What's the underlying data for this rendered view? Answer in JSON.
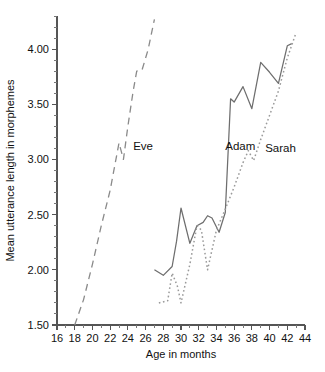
{
  "chart_data": {
    "type": "line",
    "title": "",
    "xlabel": "Age in months",
    "ylabel": "Mean utterance length in morphemes",
    "xlim": [
      16,
      44
    ],
    "ylim": [
      1.5,
      4.3
    ],
    "xticks": [
      16,
      18,
      20,
      22,
      24,
      26,
      28,
      30,
      32,
      34,
      36,
      38,
      40,
      42,
      44
    ],
    "xticklabels": [
      "16",
      "18",
      "20",
      "22",
      "24",
      "26",
      "28",
      "30",
      "32",
      "34",
      "36",
      "38",
      "40",
      "42",
      "44"
    ],
    "yticks": [
      1.5,
      2.0,
      2.5,
      3.0,
      3.5,
      4.0
    ],
    "yticklabels": [
      "1.50",
      "2.00",
      "2.50",
      "3.00",
      "3.50",
      "4.00"
    ],
    "x_minor_step": 1,
    "y_minor_step": 0.1,
    "grid": false,
    "legend": "inline-labels",
    "series": [
      {
        "name": "Eve",
        "style": "dashed",
        "color": "#8a8a8a",
        "label_x": 24.6,
        "label_y": 3.12,
        "points": [
          {
            "x": 18.0,
            "y": 1.5
          },
          {
            "x": 19.0,
            "y": 1.73
          },
          {
            "x": 20.0,
            "y": 2.05
          },
          {
            "x": 21.0,
            "y": 2.4
          },
          {
            "x": 22.0,
            "y": 2.72
          },
          {
            "x": 23.0,
            "y": 3.15
          },
          {
            "x": 23.5,
            "y": 3.0
          },
          {
            "x": 24.0,
            "y": 3.3
          },
          {
            "x": 24.6,
            "y": 3.62
          },
          {
            "x": 25.0,
            "y": 3.8
          },
          {
            "x": 25.6,
            "y": 3.81
          },
          {
            "x": 26.3,
            "y": 4.0
          },
          {
            "x": 27.0,
            "y": 4.27
          }
        ]
      },
      {
        "name": "Adam",
        "style": "solid",
        "color": "#6e6e6e",
        "label_x": 35.0,
        "label_y": 3.12,
        "points": [
          {
            "x": 27.0,
            "y": 2.0
          },
          {
            "x": 28.0,
            "y": 1.95
          },
          {
            "x": 29.0,
            "y": 2.03
          },
          {
            "x": 29.5,
            "y": 2.26
          },
          {
            "x": 30.0,
            "y": 2.56
          },
          {
            "x": 31.0,
            "y": 2.24
          },
          {
            "x": 31.8,
            "y": 2.4
          },
          {
            "x": 32.5,
            "y": 2.43
          },
          {
            "x": 33.0,
            "y": 2.49
          },
          {
            "x": 33.5,
            "y": 2.47
          },
          {
            "x": 34.3,
            "y": 2.34
          },
          {
            "x": 35.0,
            "y": 2.52
          },
          {
            "x": 35.6,
            "y": 3.55
          },
          {
            "x": 36.0,
            "y": 3.52
          },
          {
            "x": 37.0,
            "y": 3.66
          },
          {
            "x": 38.0,
            "y": 3.46
          },
          {
            "x": 39.0,
            "y": 3.88
          },
          {
            "x": 40.0,
            "y": 3.79
          },
          {
            "x": 41.0,
            "y": 3.69
          },
          {
            "x": 42.0,
            "y": 4.03
          },
          {
            "x": 42.5,
            "y": 4.05
          }
        ]
      },
      {
        "name": "Sarah",
        "style": "dotted",
        "color": "#9a9a9a",
        "label_x": 39.5,
        "label_y": 3.1,
        "points": [
          {
            "x": 27.5,
            "y": 1.7
          },
          {
            "x": 28.5,
            "y": 1.72
          },
          {
            "x": 29.0,
            "y": 1.97
          },
          {
            "x": 29.6,
            "y": 1.85
          },
          {
            "x": 30.0,
            "y": 1.7
          },
          {
            "x": 31.0,
            "y": 2.05
          },
          {
            "x": 31.8,
            "y": 2.4
          },
          {
            "x": 32.3,
            "y": 2.36
          },
          {
            "x": 33.0,
            "y": 2.0
          },
          {
            "x": 34.0,
            "y": 2.36
          },
          {
            "x": 35.0,
            "y": 2.55
          },
          {
            "x": 36.0,
            "y": 2.75
          },
          {
            "x": 37.0,
            "y": 2.97
          },
          {
            "x": 37.6,
            "y": 3.08
          },
          {
            "x": 38.2,
            "y": 2.99
          },
          {
            "x": 39.0,
            "y": 3.18
          },
          {
            "x": 40.0,
            "y": 3.4
          },
          {
            "x": 41.0,
            "y": 3.62
          },
          {
            "x": 42.0,
            "y": 3.92
          },
          {
            "x": 43.0,
            "y": 4.15
          }
        ]
      }
    ]
  }
}
